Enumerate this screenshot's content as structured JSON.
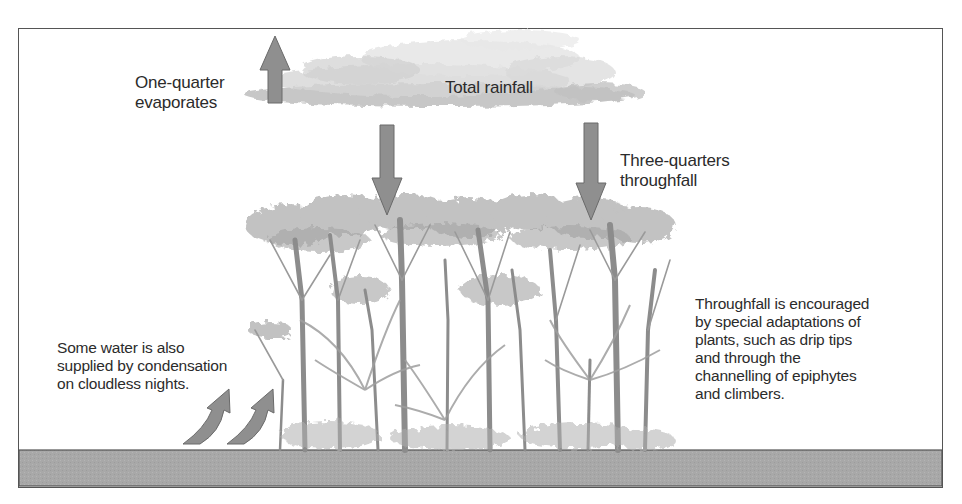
{
  "diagram": {
    "colors": {
      "arrow_fill": "#8f8f8f",
      "arrow_stroke": "#6a6a6a",
      "ground": "#a9a9a9",
      "frame": "#555555",
      "cloud": "#c9c9c9",
      "foliage": "#b3b3b3",
      "trunk": "#8a8a8a",
      "text": "#2b2b2b"
    },
    "labels": {
      "evaporation": {
        "lines": [
          "One-quarter",
          "evaporates"
        ]
      },
      "rainfall": {
        "text": "Total rainfall"
      },
      "throughfall": {
        "lines": [
          "Three-quarters",
          "throughfall"
        ]
      },
      "condensation": {
        "lines": [
          "Some water is also",
          "supplied by condensation",
          "on cloudless nights."
        ]
      },
      "adaptations": {
        "lines": [
          "Throughfall is encouraged",
          "by special adaptations of",
          "plants, such as drip tips",
          "and through the",
          "channelling of epiphytes",
          "and climbers."
        ]
      }
    },
    "arrows": [
      {
        "id": "evaporation-arrow",
        "direction": "up",
        "meaning": "One-quarter evaporates"
      },
      {
        "id": "throughfall-arrow-left",
        "direction": "down",
        "meaning": "Rainfall onto canopy"
      },
      {
        "id": "throughfall-arrow-right",
        "direction": "down",
        "meaning": "Three-quarters throughfall"
      },
      {
        "id": "condensation-arrow-1",
        "direction": "curved-up",
        "meaning": "Condensation"
      },
      {
        "id": "condensation-arrow-2",
        "direction": "curved-up",
        "meaning": "Condensation"
      }
    ]
  }
}
